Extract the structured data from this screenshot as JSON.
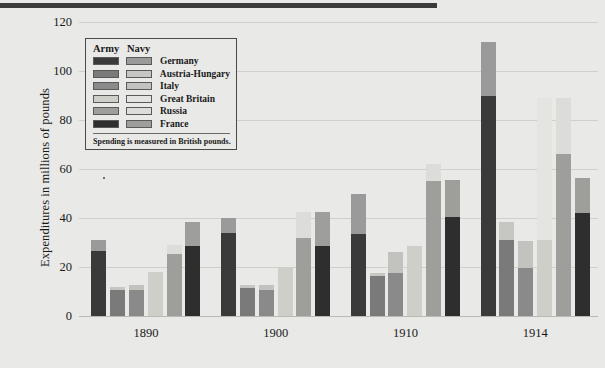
{
  "figure": {
    "ylabel": "Expenditures in millions of pounds",
    "legend_title_army": "Army",
    "legend_title_navy": "Navy",
    "legend_note": "Spending is measured in British pounds."
  },
  "chart_data": {
    "type": "bar",
    "subtype": "grouped-stacked",
    "title": "",
    "xlabel": "",
    "ylabel": "Expenditures in millions of pounds",
    "ylim": [
      0,
      120
    ],
    "yticks": [
      0,
      20,
      40,
      60,
      80,
      100,
      120
    ],
    "ytick_labels": [
      "0",
      "20",
      "40",
      "60",
      "80",
      "100",
      "120"
    ],
    "grid": true,
    "legend_position": "upper-left-inset",
    "categories": [
      "1890",
      "1900",
      "1910",
      "1914"
    ],
    "countries": [
      "Germany",
      "Austria-Hungary",
      "Italy",
      "Great Britain",
      "Russia",
      "France"
    ],
    "stack_parts": [
      "Army",
      "Navy"
    ],
    "colors": {
      "Germany": {
        "army": "#3a3a3a",
        "navy": "#9a9a9a"
      },
      "Austria-Hungary": {
        "army": "#7a7a7a",
        "navy": "#c6c6c2"
      },
      "Italy": {
        "army": "#8a8a8a",
        "navy": "#c2c2be"
      },
      "Great Britain": {
        "army": "#cfcfca",
        "navy": "#e4e4e0"
      },
      "Russia": {
        "army": "#9e9e9a",
        "navy": "#dcdcd8"
      },
      "France": {
        "army": "#2e2e2e",
        "navy": "#9e9e9a"
      }
    },
    "series": [
      {
        "name": "Germany Army",
        "values": [
          26.5,
          34.0,
          33.5,
          90.0
        ]
      },
      {
        "name": "Germany Navy",
        "values": [
          4.5,
          6.0,
          16.5,
          22.0
        ]
      },
      {
        "name": "Austria-Hungary Army",
        "values": [
          10.5,
          11.5,
          16.5,
          31.0
        ]
      },
      {
        "name": "Austria-Hungary Navy",
        "values": [
          1.5,
          1.0,
          1.0,
          7.5
        ]
      },
      {
        "name": "Italy Army",
        "values": [
          10.5,
          10.5,
          17.5,
          19.5
        ]
      },
      {
        "name": "Italy Navy",
        "values": [
          2.0,
          2.0,
          8.5,
          11.0
        ]
      },
      {
        "name": "Great Britain Army",
        "values": [
          18.0,
          20.0,
          28.5,
          31.0
        ]
      },
      {
        "name": "Great Britain Navy",
        "values": [
          0.0,
          0.0,
          0.0,
          58.0
        ]
      },
      {
        "name": "Russia Army",
        "values": [
          25.5,
          32.0,
          55.0,
          66.0
        ]
      },
      {
        "name": "Russia Navy",
        "values": [
          3.5,
          10.5,
          7.0,
          23.0
        ]
      },
      {
        "name": "France Army",
        "values": [
          28.5,
          28.5,
          40.5,
          42.0
        ]
      },
      {
        "name": "France Navy",
        "values": [
          10.0,
          14.0,
          15.0,
          14.5
        ]
      }
    ],
    "stacks": [
      {
        "group": "1890",
        "country": "Germany",
        "army": 26.5,
        "navy": 4.5,
        "total": 31.0
      },
      {
        "group": "1890",
        "country": "Austria-Hungary",
        "army": 10.5,
        "navy": 1.5,
        "total": 12.0
      },
      {
        "group": "1890",
        "country": "Italy",
        "army": 10.5,
        "navy": 2.0,
        "total": 12.5
      },
      {
        "group": "1890",
        "country": "Great Britain",
        "army": 18.0,
        "navy": 0.0,
        "total": 18.0
      },
      {
        "group": "1890",
        "country": "Russia",
        "army": 25.5,
        "navy": 3.5,
        "total": 29.0
      },
      {
        "group": "1890",
        "country": "France",
        "army": 28.5,
        "navy": 10.0,
        "total": 38.5
      },
      {
        "group": "1900",
        "country": "Germany",
        "army": 34.0,
        "navy": 6.0,
        "total": 40.0
      },
      {
        "group": "1900",
        "country": "Austria-Hungary",
        "army": 11.5,
        "navy": 1.0,
        "total": 12.5
      },
      {
        "group": "1900",
        "country": "Italy",
        "army": 10.5,
        "navy": 2.0,
        "total": 12.5
      },
      {
        "group": "1900",
        "country": "Great Britain",
        "army": 20.0,
        "navy": 0.0,
        "total": 20.0
      },
      {
        "group": "1900",
        "country": "Russia",
        "army": 32.0,
        "navy": 10.5,
        "total": 42.5
      },
      {
        "group": "1900",
        "country": "France",
        "army": 28.5,
        "navy": 14.0,
        "total": 42.5
      },
      {
        "group": "1910",
        "country": "Germany",
        "army": 33.5,
        "navy": 16.5,
        "total": 50.0
      },
      {
        "group": "1910",
        "country": "Austria-Hungary",
        "army": 16.5,
        "navy": 1.0,
        "total": 17.5
      },
      {
        "group": "1910",
        "country": "Italy",
        "army": 17.5,
        "navy": 8.5,
        "total": 26.0
      },
      {
        "group": "1910",
        "country": "Great Britain",
        "army": 28.5,
        "navy": 0.0,
        "total": 28.5
      },
      {
        "group": "1910",
        "country": "Russia",
        "army": 55.0,
        "navy": 7.0,
        "total": 62.0
      },
      {
        "group": "1910",
        "country": "France",
        "army": 40.5,
        "navy": 15.0,
        "total": 55.5
      },
      {
        "group": "1914",
        "country": "Germany",
        "army": 90.0,
        "navy": 22.0,
        "total": 112.0
      },
      {
        "group": "1914",
        "country": "Austria-Hungary",
        "army": 31.0,
        "navy": 7.5,
        "total": 38.5
      },
      {
        "group": "1914",
        "country": "Italy",
        "army": 19.5,
        "navy": 11.0,
        "total": 30.5
      },
      {
        "group": "1914",
        "country": "Great Britain",
        "army": 31.0,
        "navy": 58.0,
        "total": 89.0
      },
      {
        "group": "1914",
        "country": "Russia",
        "army": 66.0,
        "navy": 23.0,
        "total": 89.0
      },
      {
        "group": "1914",
        "country": "France",
        "army": 42.0,
        "navy": 14.5,
        "total": 56.5
      }
    ]
  }
}
